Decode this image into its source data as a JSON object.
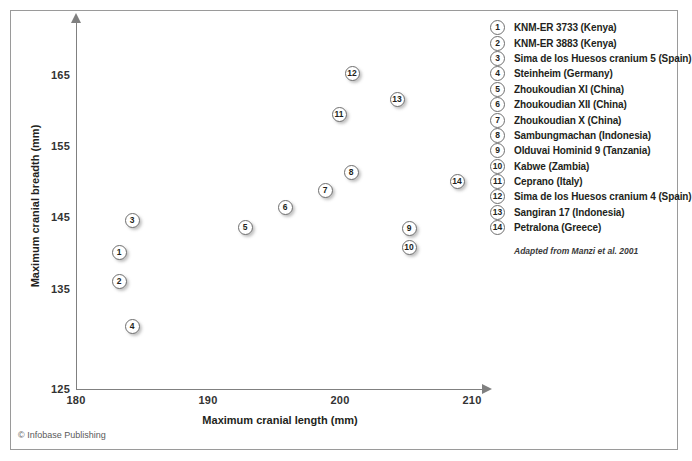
{
  "chart_data": {
    "type": "scatter",
    "title": "",
    "xlabel": "Maximum cranial length (mm)",
    "ylabel": "Maximum cranial breadth (mm)",
    "xlim": [
      180,
      210
    ],
    "ylim": [
      125,
      168
    ],
    "xticks": [
      180,
      190,
      200,
      210
    ],
    "yticks": [
      125,
      135,
      145,
      155,
      165
    ],
    "xtick_labels": [
      "180",
      "190",
      "200",
      "210"
    ],
    "ytick_labels": [
      "125",
      "135",
      "145",
      "155",
      "165"
    ],
    "grid": false,
    "legend_position": "right",
    "annotation": "Adapted from Manzi et al. 2001",
    "points": [
      {
        "id": "1",
        "label": "KNM-ER 3733 (Kenya)",
        "x": 183.3,
        "y": 144.1,
        "px": 119,
        "py": 252
      },
      {
        "id": "2",
        "label": "KNM-ER 3883 (Kenya)",
        "x": 183.3,
        "y": 140.1,
        "px": 119,
        "py": 281
      },
      {
        "id": "3",
        "label": "Sima de los Huesos cranium 5 (Spain)",
        "x": 184.2,
        "y": 148.5,
        "px": 132,
        "py": 220
      },
      {
        "id": "4",
        "label": "Steinheim (Germany)",
        "x": 184.2,
        "y": 133.8,
        "px": 132,
        "py": 326
      },
      {
        "id": "5",
        "label": "Zhoukoudian XI (China)",
        "x": 192.8,
        "y": 145.2,
        "px": 245,
        "py": 227
      },
      {
        "id": "6",
        "label": "Zhoukoudian XII (China)",
        "x": 195.8,
        "y": 147.9,
        "px": 285,
        "py": 207
      },
      {
        "id": "7",
        "label": "Zhoukoudian X (China)",
        "x": 198.8,
        "y": 150.3,
        "px": 325,
        "py": 190
      },
      {
        "id": "8",
        "label": "Sambungmachan (Indonesia)",
        "x": 200.8,
        "y": 151.4,
        "px": 351,
        "py": 172
      },
      {
        "id": "9",
        "label": "Olduvai Hominid 9 (Tanzania)",
        "x": 205.2,
        "y": 147.3,
        "px": 409,
        "py": 228
      },
      {
        "id": "10",
        "label": "Kabwe (Zambia)",
        "x": 205.2,
        "y": 144.6,
        "px": 409,
        "py": 247
      },
      {
        "id": "11",
        "label": "Ceprano (Italy)",
        "x": 199.9,
        "y": 158.2,
        "px": 339,
        "py": 114
      },
      {
        "id": "12",
        "label": "Sima de los Huesos cranium 4 (Spain)",
        "x": 200.9,
        "y": 163.9,
        "px": 352,
        "py": 73
      },
      {
        "id": "13",
        "label": "Sangiran 17 (Indonesia)",
        "x": 204.3,
        "y": 160.3,
        "px": 397,
        "py": 99
      },
      {
        "id": "14",
        "label": "Petralona (Greece)",
        "x": 208.9,
        "y": 149.0,
        "px": 457,
        "py": 181
      }
    ]
  },
  "axes": {
    "x": {
      "title": "Maximum cranial length (mm)",
      "ticks": [
        {
          "value": "180",
          "px": 76
        },
        {
          "value": "190",
          "px": 208
        },
        {
          "value": "200",
          "px": 340
        },
        {
          "value": "210",
          "px": 472
        }
      ]
    },
    "y": {
      "title": "Maximum cranial breadth (mm)",
      "ticks": [
        {
          "value": "165",
          "py": 75
        },
        {
          "value": "155",
          "py": 146
        },
        {
          "value": "145",
          "py": 217
        },
        {
          "value": "135",
          "py": 289
        },
        {
          "value": "125",
          "py": 389
        }
      ]
    }
  },
  "legend": {
    "items": [
      {
        "key": "1",
        "label": "KNM-ER 3733 (Kenya)"
      },
      {
        "key": "2",
        "label": "KNM-ER 3883 (Kenya)"
      },
      {
        "key": "3",
        "label": "Sima de los Huesos cranium 5 (Spain)"
      },
      {
        "key": "4",
        "label": "Steinheim (Germany)"
      },
      {
        "key": "5",
        "label": "Zhoukoudian XI (China)"
      },
      {
        "key": "6",
        "label": "Zhoukoudian XII (China)"
      },
      {
        "key": "7",
        "label": "Zhoukoudian X (China)"
      },
      {
        "key": "8",
        "label": "Sambungmachan (Indonesia)"
      },
      {
        "key": "9",
        "label": "Olduvai Hominid 9 (Tanzania)"
      },
      {
        "key": "10",
        "label": "Kabwe (Zambia)"
      },
      {
        "key": "11",
        "label": "Ceprano (Italy)"
      },
      {
        "key": "12",
        "label": "Sima de los Huesos cranium 4 (Spain)"
      },
      {
        "key": "13",
        "label": "Sangiran 17 (Indonesia)"
      },
      {
        "key": "14",
        "label": "Petralona (Greece)"
      }
    ]
  },
  "source_note": "Adapted from Manzi et al. 2001",
  "copyright": "© Infobase Publishing",
  "colors": {
    "frame": "#9a9a9a",
    "axis": "#808080",
    "marker_outline": "#6f6f6f",
    "marker_fill": "#ffffff",
    "text": "#231f20"
  }
}
